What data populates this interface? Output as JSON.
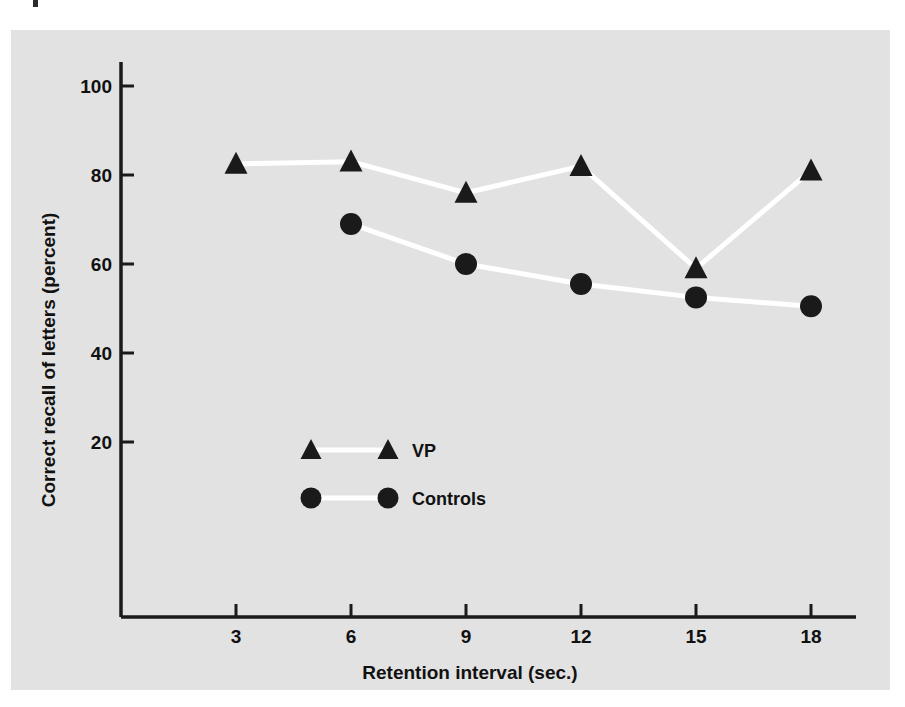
{
  "figure": {
    "background_color": "#e2e2e2",
    "page_color": "#ffffff",
    "ink_color": "#1a1a1a",
    "line_color": "#ffffff"
  },
  "chart_data": {
    "type": "line",
    "title": "",
    "subtitle": "",
    "xlabel": "Retention interval (sec.)",
    "ylabel": "Correct recall of letters (percent)",
    "x": [
      3,
      6,
      9,
      12,
      15,
      18
    ],
    "xticklabels": [
      "3",
      "6",
      "9",
      "12",
      "15",
      "18"
    ],
    "yticks": [
      20,
      40,
      60,
      80,
      100
    ],
    "yticklabels": [
      "20",
      "40",
      "60",
      "80",
      "100"
    ],
    "xlim": [
      1.3,
      19.6
    ],
    "ylim": [
      0,
      112
    ],
    "grid": false,
    "legend_position": "center-left-inside",
    "series": [
      {
        "name": "VP",
        "marker": "triangle",
        "color": "#1a1a1a",
        "line_color": "#ffffff",
        "x": [
          3,
          6,
          9,
          12,
          15,
          18
        ],
        "values": [
          82.5,
          83,
          76,
          82,
          59,
          81
        ]
      },
      {
        "name": "Controls",
        "marker": "circle",
        "color": "#1a1a1a",
        "line_color": "#ffffff",
        "x": [
          6,
          9,
          12,
          15,
          18
        ],
        "values": [
          69,
          60,
          55.5,
          52.5,
          50.5
        ]
      }
    ],
    "legend": [
      {
        "label": "VP",
        "marker": "triangle"
      },
      {
        "label": "Controls",
        "marker": "circle"
      }
    ]
  }
}
